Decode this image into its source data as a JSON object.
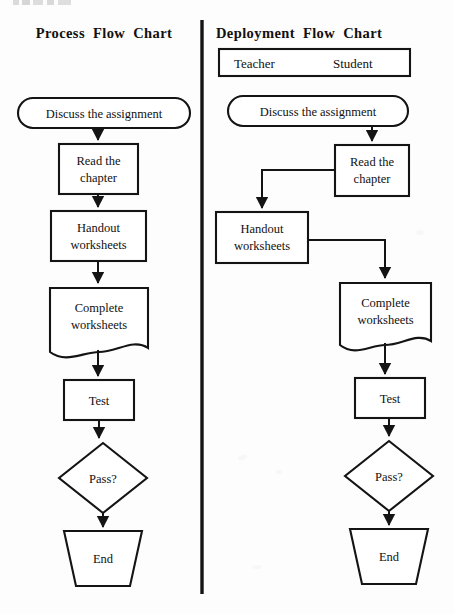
{
  "page": {
    "background_color": "#fdfdfd",
    "ink_color": "#141414",
    "width": 454,
    "height": 614,
    "cropped_top_fragment": ""
  },
  "left_chart": {
    "title": "Process Flow Chart",
    "nodes": [
      {
        "id": "start",
        "label": "Discuss the assignment",
        "shape": "rounded-rectangle"
      },
      {
        "id": "read",
        "label": "Read the\nchapter",
        "line1": "Read the",
        "line2": "chapter",
        "shape": "rectangle"
      },
      {
        "id": "handout",
        "label": "Handout\nworksheets",
        "line1": "Handout",
        "line2": "worksheets",
        "shape": "rectangle"
      },
      {
        "id": "complete",
        "label": "Complete\nworksheets",
        "line1": "Complete",
        "line2": "worksheets",
        "shape": "document"
      },
      {
        "id": "test",
        "label": "Test",
        "shape": "rectangle"
      },
      {
        "id": "pass",
        "label": "Pass?",
        "shape": "diamond"
      },
      {
        "id": "end",
        "label": "End",
        "shape": "trapezoid"
      }
    ],
    "edges": [
      {
        "from": "start",
        "to": "read"
      },
      {
        "from": "read",
        "to": "handout"
      },
      {
        "from": "handout",
        "to": "complete"
      },
      {
        "from": "complete",
        "to": "test"
      },
      {
        "from": "test",
        "to": "pass"
      },
      {
        "from": "pass",
        "to": "end"
      }
    ]
  },
  "right_chart": {
    "title": "Deployment Flow Chart",
    "lanes": [
      {
        "id": "teacher",
        "label": "Teacher"
      },
      {
        "id": "student",
        "label": "Student"
      }
    ],
    "nodes": [
      {
        "id": "start",
        "label": "Discuss the assignment",
        "shape": "rounded-rectangle",
        "lane": "both"
      },
      {
        "id": "read",
        "line1": "Read the",
        "line2": "chapter",
        "shape": "rectangle",
        "lane": "student"
      },
      {
        "id": "handout",
        "line1": "Handout",
        "line2": "worksheets",
        "shape": "rectangle",
        "lane": "teacher"
      },
      {
        "id": "complete",
        "line1": "Complete",
        "line2": "worksheets",
        "shape": "document",
        "lane": "student"
      },
      {
        "id": "test",
        "label": "Test",
        "shape": "rectangle",
        "lane": "student"
      },
      {
        "id": "pass",
        "label": "Pass?",
        "shape": "diamond",
        "lane": "student"
      },
      {
        "id": "end",
        "label": "End",
        "shape": "trapezoid",
        "lane": "student"
      }
    ],
    "edges": [
      {
        "from": "start",
        "to": "read",
        "routing": "vertical"
      },
      {
        "from": "read",
        "to": "handout",
        "routing": "left-then-down"
      },
      {
        "from": "handout",
        "to": "complete",
        "routing": "right-then-down"
      },
      {
        "from": "complete",
        "to": "test",
        "routing": "vertical"
      },
      {
        "from": "test",
        "to": "pass",
        "routing": "vertical"
      },
      {
        "from": "pass",
        "to": "end",
        "routing": "vertical"
      }
    ]
  },
  "divider": {
    "name": "vertical-rule"
  }
}
